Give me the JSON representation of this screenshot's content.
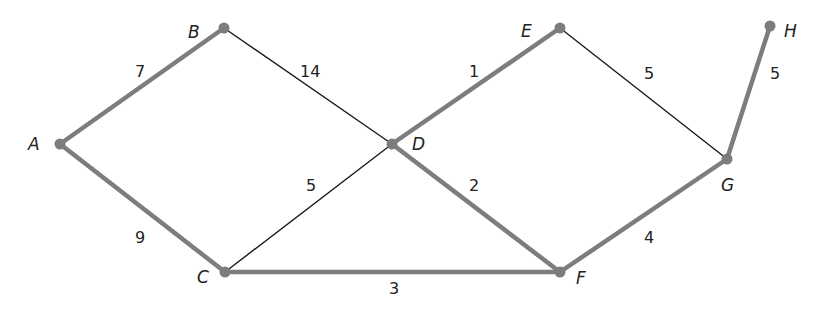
{
  "diagram": {
    "type": "weighted-graph",
    "colors": {
      "tree_edge": "#7d7d7d",
      "other_edge": "#1a1a1a",
      "node": "#7d7d7d",
      "text": "#222222"
    },
    "nodes": [
      {
        "id": "A",
        "label": "A",
        "x": 60,
        "y": 144,
        "lx": 28,
        "ly": 150
      },
      {
        "id": "B",
        "label": "B",
        "x": 224,
        "y": 28,
        "lx": 188,
        "ly": 38
      },
      {
        "id": "C",
        "label": "C",
        "x": 225,
        "y": 272,
        "lx": 197,
        "ly": 283
      },
      {
        "id": "D",
        "label": "D",
        "x": 392,
        "y": 144,
        "lx": 412,
        "ly": 150
      },
      {
        "id": "E",
        "label": "E",
        "x": 560,
        "y": 28,
        "lx": 521,
        "ly": 37
      },
      {
        "id": "F",
        "label": "F",
        "x": 560,
        "y": 272,
        "lx": 576,
        "ly": 284
      },
      {
        "id": "G",
        "label": "G",
        "x": 727,
        "y": 159,
        "lx": 721,
        "ly": 191
      },
      {
        "id": "H",
        "label": "H",
        "x": 770,
        "y": 26,
        "lx": 784,
        "ly": 37
      }
    ],
    "edges": [
      {
        "from": "A",
        "to": "B",
        "weight": "7",
        "highlighted": true,
        "wx": 135,
        "wy": 77
      },
      {
        "from": "A",
        "to": "C",
        "weight": "9",
        "highlighted": true,
        "wx": 135,
        "wy": 243
      },
      {
        "from": "B",
        "to": "D",
        "weight": "14",
        "highlighted": false,
        "wx": 300,
        "wy": 77
      },
      {
        "from": "C",
        "to": "D",
        "weight": "5",
        "highlighted": false,
        "wx": 306,
        "wy": 191
      },
      {
        "from": "C",
        "to": "F",
        "weight": "3",
        "highlighted": true,
        "wx": 389,
        "wy": 294
      },
      {
        "from": "D",
        "to": "E",
        "weight": "1",
        "highlighted": true,
        "wx": 469,
        "wy": 77
      },
      {
        "from": "D",
        "to": "F",
        "weight": "2",
        "highlighted": true,
        "wx": 469,
        "wy": 191
      },
      {
        "from": "E",
        "to": "G",
        "weight": "5",
        "highlighted": false,
        "wx": 644,
        "wy": 79
      },
      {
        "from": "F",
        "to": "G",
        "weight": "4",
        "highlighted": true,
        "wx": 644,
        "wy": 243
      },
      {
        "from": "G",
        "to": "H",
        "weight": "5",
        "highlighted": true,
        "wx": 770,
        "wy": 79
      }
    ]
  }
}
